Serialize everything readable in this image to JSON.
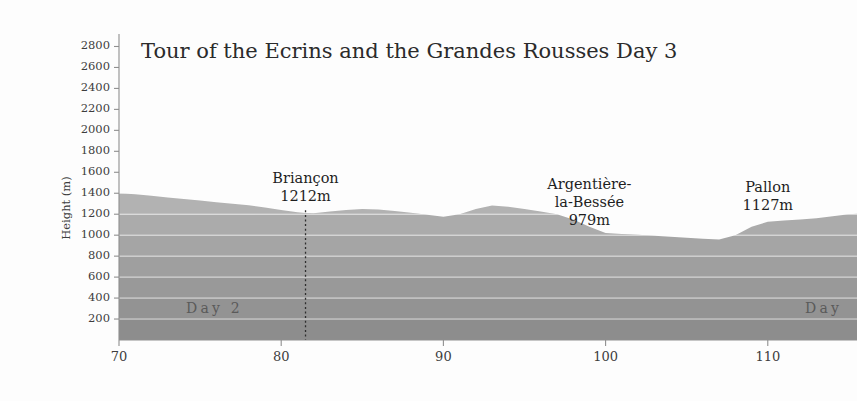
{
  "figure": {
    "title": "Tour of the Ecrins and the Grandes Rousses Day 3",
    "background_color": "#fdfdfd"
  },
  "axes": {
    "y_axis_title": "Height (m)",
    "y_tick_labels": [
      "2800",
      "2600",
      "2400",
      "2200",
      "2000",
      "1800",
      "1600",
      "1400",
      "1200",
      "1000",
      "800",
      "600",
      "400",
      "200"
    ],
    "x_tick_labels": [
      "70",
      "80",
      "90",
      "100",
      "110"
    ]
  },
  "annotations": {
    "places": [
      {
        "name": "briancon",
        "lines": [
          "Briançon",
          "1212m"
        ]
      },
      {
        "name": "argentiere-la-bessee",
        "lines": [
          "Argentière-",
          "la-Bessée",
          "979m"
        ]
      },
      {
        "name": "pallon",
        "lines": [
          "Pallon",
          "1127m"
        ]
      }
    ],
    "day_left": "Day 2",
    "day_right": "Day"
  },
  "chart_data": {
    "type": "area",
    "title": "Tour of the Ecrins and the Grandes Rousses Day 3",
    "xlabel": "",
    "ylabel": "Height (m)",
    "xlim": [
      70,
      115.5
    ],
    "ylim": [
      0,
      2900
    ],
    "ytick_step": 200,
    "yticks": [
      200,
      400,
      600,
      800,
      1000,
      1200,
      1400,
      1600,
      1800,
      2000,
      2200,
      2400,
      2600,
      2800
    ],
    "xticks": [
      70,
      80,
      90,
      100,
      110
    ],
    "grid": true,
    "legend_position": "none",
    "series": [
      {
        "name": "Elevation profile",
        "x": [
          70.0,
          71.0,
          72.0,
          73.0,
          74.0,
          75.0,
          76.0,
          77.0,
          78.0,
          79.0,
          80.0,
          81.0,
          81.5,
          82.0,
          83.0,
          84.0,
          85.0,
          86.0,
          87.0,
          88.0,
          89.0,
          90.0,
          91.0,
          92.0,
          93.0,
          94.0,
          95.0,
          96.0,
          97.0,
          98.0,
          99.0,
          100.0,
          101.0,
          102.0,
          103.0,
          104.0,
          105.0,
          106.0,
          107.0,
          108.0,
          109.0,
          110.0,
          111.0,
          112.0,
          113.0,
          114.0,
          115.0,
          115.5
        ],
        "y": [
          1400,
          1390,
          1375,
          1360,
          1345,
          1330,
          1315,
          1300,
          1285,
          1265,
          1240,
          1218,
          1212,
          1210,
          1225,
          1240,
          1250,
          1245,
          1230,
          1215,
          1195,
          1175,
          1200,
          1250,
          1283,
          1270,
          1250,
          1225,
          1200,
          1150,
          1080,
          1020,
          1010,
          1005,
          995,
          985,
          975,
          965,
          958,
          1000,
          1080,
          1127,
          1140,
          1150,
          1162,
          1180,
          1200,
          1205
        ]
      }
    ],
    "annotations": [
      {
        "label": "Briançon",
        "value_label": "1212m",
        "x": 81.5,
        "y": 1212
      },
      {
        "label": "Argentière-la-Bessée",
        "value_label": "979m",
        "x": 99.0,
        "y": 979
      },
      {
        "label": "Pallon",
        "value_label": "1127m",
        "x": 110.0,
        "y": 1127
      }
    ],
    "stage_dividers": [
      {
        "label": "Day 2",
        "x": 81.5
      }
    ],
    "band_shading": {
      "description": "Area fill drawn as horizontal bands darkening toward the baseline, one band per 200 m",
      "colors": [
        "#d9d9d9",
        "#d4d4d4",
        "#cfcfcf",
        "#cacaca",
        "#c4c4c4",
        "#bebebe",
        "#b8b8b8",
        "#b2b2b2",
        "#ababab",
        "#a5a5a5",
        "#9f9f9f",
        "#999999",
        "#939393",
        "#8d8d8d"
      ]
    }
  }
}
